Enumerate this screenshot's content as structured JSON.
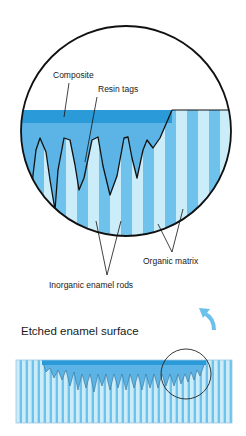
{
  "labels": {
    "composite": "Composite",
    "resin_tags": "Resin tags",
    "organic_matrix": "Organic matrix",
    "inorganic_rods": "Inorganic enamel rods",
    "etched_surface": "Etched enamel surface"
  },
  "colors": {
    "composite_dark": "#2a9ad8",
    "composite_resin": "#5bb4e5",
    "rod_medium": "#6fc2ec",
    "matrix_light": "#cbecf9",
    "outline": "#111111",
    "arrow": "#6cc0ec"
  },
  "icons": {
    "magnify_arrow": "curved-arrow-up-left"
  }
}
